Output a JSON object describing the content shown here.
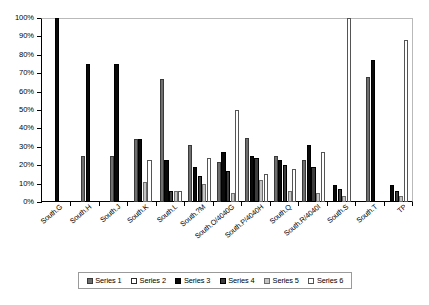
{
  "chart_data": {
    "type": "bar",
    "title": "",
    "xlabel": "",
    "ylabel": "",
    "ylim": [
      0,
      100
    ],
    "ytick_labels": [
      "100%",
      "90%",
      "80%",
      "70%",
      "60%",
      "50%",
      "40%",
      "30%",
      "20%",
      "10%",
      "0%"
    ],
    "ytick_values": [
      100,
      90,
      80,
      70,
      60,
      50,
      40,
      30,
      20,
      10,
      0
    ],
    "grid": false,
    "legend_position": "bottom",
    "value_unit": "percent",
    "categories": [
      "South.G",
      "South.H",
      "South.J",
      "South.K",
      "South.L",
      "South.?M",
      "South.O/4040G",
      "South.P/4040H",
      "South.Q",
      "South.R/4040I",
      "South.S",
      "South.T",
      "TP"
    ],
    "series": [
      {
        "name": "Series 1",
        "color": "#6f6f6f",
        "values": [
          0,
          25,
          25,
          34,
          67,
          31,
          22,
          35,
          25,
          23,
          0,
          68,
          0
        ]
      },
      {
        "name": "Series 2",
        "color": "#ffffff",
        "values": [
          0,
          0,
          0,
          0,
          0,
          0,
          0,
          0,
          0,
          0,
          0,
          0,
          0
        ]
      },
      {
        "name": "Series 3",
        "color": "#0a0a0a",
        "values": [
          100,
          75,
          75,
          34,
          23,
          19,
          27,
          25,
          23,
          31,
          9,
          77,
          9
        ]
      },
      {
        "name": "Series 4",
        "color": "#3d3d3d",
        "values": [
          0,
          0,
          0,
          0,
          6,
          14,
          17,
          24,
          20,
          19,
          7,
          0,
          6
        ]
      },
      {
        "name": "Series 5",
        "color": "#c4c4c4",
        "values": [
          0,
          0,
          0,
          11,
          6,
          10,
          5,
          12,
          6,
          5,
          3,
          0,
          3
        ]
      },
      {
        "name": "Series 6",
        "color": "#ffffff",
        "values": [
          0,
          0,
          0,
          23,
          6,
          24,
          50,
          15,
          18,
          27,
          100,
          0,
          88
        ]
      }
    ]
  },
  "legend": {
    "items": [
      {
        "label": "Series 1",
        "swatch_class": "s1"
      },
      {
        "label": "Series 2",
        "swatch_class": "s2"
      },
      {
        "label": "Series 3",
        "swatch_class": "s3"
      },
      {
        "label": "Series 4",
        "swatch_class": "s4"
      },
      {
        "label": "Series 5",
        "swatch_class": "s5"
      },
      {
        "label": "Series 6",
        "swatch_class": "s6"
      }
    ]
  }
}
